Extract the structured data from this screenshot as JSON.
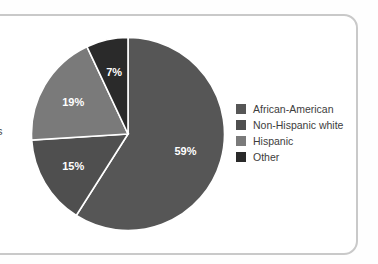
{
  "frame": {
    "border_color": "#c9c9c9"
  },
  "edge_fragment": {
    "text": "s"
  },
  "legend": {
    "items": [
      {
        "label": "African-American",
        "color": "#565656"
      },
      {
        "label": "Non-Hispanic white",
        "color": "#4f4f4f"
      },
      {
        "label": "Hispanic",
        "color": "#7a7a7a"
      },
      {
        "label": "Other",
        "color": "#2a2a2a"
      }
    ]
  },
  "chart_data": {
    "type": "pie",
    "title": "",
    "labels": [
      "African-American",
      "Non-Hispanic white",
      "Hispanic",
      "Other"
    ],
    "values": [
      59,
      15,
      19,
      7
    ],
    "value_labels": [
      "59%",
      "15%",
      "19%",
      "7%"
    ],
    "colors": [
      "#565656",
      "#4f4f4f",
      "#7a7a7a",
      "#2a2a2a"
    ],
    "units": "percent",
    "start_angle_deg": 0,
    "direction": "clockwise",
    "separator_color": "#ffffff",
    "legend_position": "right",
    "grid": false
  }
}
